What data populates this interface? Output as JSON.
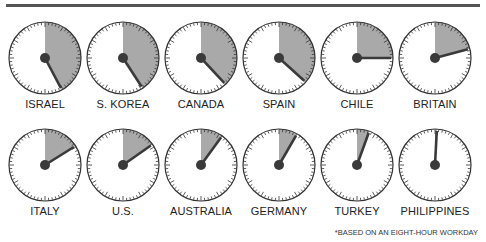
{
  "chart_data": {
    "type": "gauge",
    "title": "",
    "unit": "hours of an eight-hour workday (dial shading)",
    "footnote": "*BASED ON AN EIGHT-HOUR WORKDAY",
    "dials": [
      {
        "label": "ISRAEL",
        "angle_deg": 152
      },
      {
        "label": "S. KOREA",
        "angle_deg": 147
      },
      {
        "label": "CANADA",
        "angle_deg": 137
      },
      {
        "label": "SPAIN",
        "angle_deg": 132
      },
      {
        "label": "CHILE",
        "angle_deg": 90
      },
      {
        "label": "BRITAIN",
        "angle_deg": 75
      },
      {
        "label": "ITALY",
        "angle_deg": 58
      },
      {
        "label": "U.S.",
        "angle_deg": 55
      },
      {
        "label": "AUSTRALIA",
        "angle_deg": 36
      },
      {
        "label": "GERMANY",
        "angle_deg": 30
      },
      {
        "label": "TURKEY",
        "angle_deg": 20
      },
      {
        "label": "PHILIPPINES",
        "angle_deg": 3
      }
    ]
  },
  "colors": {
    "shade": "#a9a9a9",
    "hand": "#3a3a3a",
    "rim": "#333333",
    "bar": "#555555"
  },
  "footnote": "*BASED ON AN EIGHT-HOUR WORKDAY"
}
